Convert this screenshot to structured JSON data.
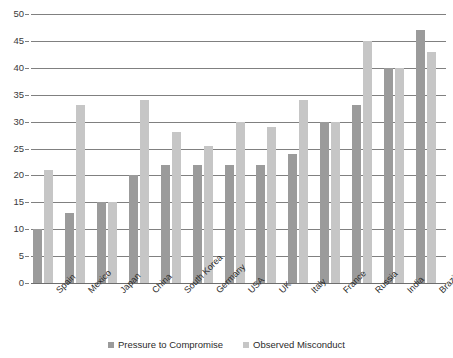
{
  "chart_data": {
    "type": "bar",
    "title": "",
    "subtitle": "",
    "xlabel": "",
    "ylabel": "",
    "ylim": [
      0,
      50
    ],
    "ytick_step": 5,
    "yticks": [
      50,
      45,
      40,
      35,
      30,
      25,
      20,
      15,
      10,
      5,
      0
    ],
    "grid": true,
    "grid_axis": "y",
    "legend_position": "bottom",
    "categories": [
      "Spain",
      "Mexico",
      "Japan",
      "China",
      "South Korea",
      "Germany",
      "USA",
      "UK",
      "Italy",
      "France",
      "Russia",
      "India",
      "Brazil"
    ],
    "series": [
      {
        "name": "Pressure to Compromise",
        "color": "#9b9b9b",
        "values": [
          10,
          13,
          15,
          20,
          22,
          22,
          22,
          22,
          24,
          30,
          33,
          40,
          47
        ]
      },
      {
        "name": "Observed Misconduct",
        "color": "#c6c6c6",
        "values": [
          21,
          33,
          15,
          34,
          28,
          25.5,
          30,
          29,
          34,
          30,
          45,
          40,
          43
        ]
      }
    ]
  },
  "axis": {
    "y_tick_labels": [
      "50",
      "45",
      "40",
      "35",
      "30",
      "25",
      "20",
      "15",
      "10",
      "5",
      "0"
    ]
  },
  "legend": {
    "items": [
      {
        "label": "Pressure to Compromise",
        "color": "#9b9b9b"
      },
      {
        "label": "Observed Misconduct",
        "color": "#c6c6c6"
      }
    ]
  }
}
